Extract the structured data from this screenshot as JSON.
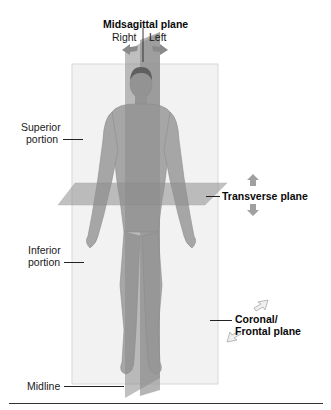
{
  "diagram": {
    "planes": {
      "midsagittal": {
        "label": "Midsagittal plane",
        "sides": [
          "Right",
          "Left"
        ]
      },
      "transverse": {
        "label": "Transverse plane"
      },
      "coronal": {
        "label_line1": "Coronal/",
        "label_line2": "Frontal plane"
      }
    },
    "portions": {
      "superior": {
        "line1": "Superior",
        "line2": "portion"
      },
      "inferior": {
        "line1": "Inferior",
        "line2": "portion"
      }
    },
    "midline": {
      "label": "Midline"
    },
    "colors": {
      "coronal_plane": "#f1f1f1",
      "coronal_border": "#d6d6d6",
      "sagittal_plane": "#8e8e8e",
      "transverse_plane": "#9a9a9a",
      "skin": "#a9a9a9",
      "arrow": "#8a8a8a",
      "text": "#111111"
    }
  }
}
